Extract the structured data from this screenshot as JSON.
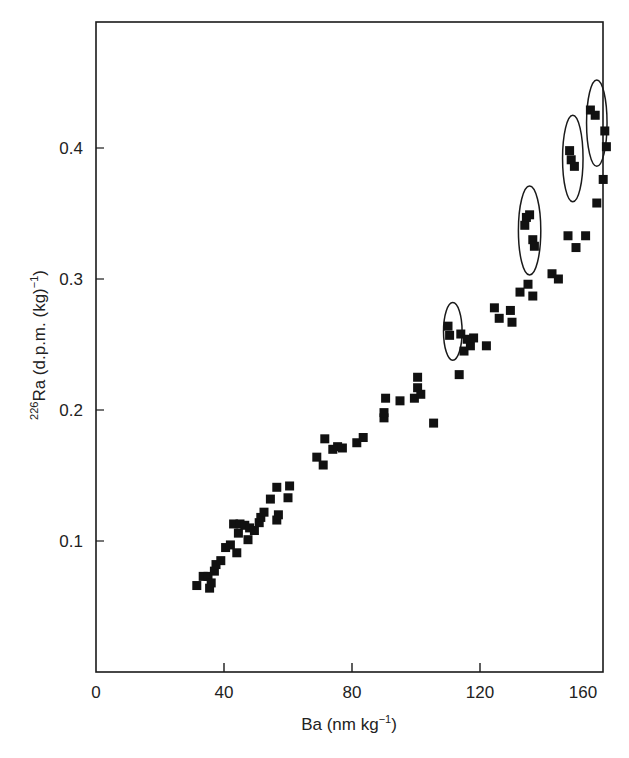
{
  "chart_data": {
    "type": "scatter",
    "title": "",
    "xlabel": "Ba (nm kg⁻¹)",
    "xlabel_parts": {
      "base": "Ba (nm kg",
      "sup": "−1",
      "end": ")"
    },
    "ylabel": "²²⁶Ra (d.p.m. (kg)⁻¹)",
    "ylabel_parts": {
      "pre_sup": "226",
      "base": "Ra (d.p.m. (kg)",
      "sup": "−1",
      "end": ")"
    },
    "xlim": [
      0,
      165
    ],
    "ylim": [
      0,
      0.49
    ],
    "x_ticks": [
      0,
      40,
      80,
      120,
      160
    ],
    "x_tick_labels": [
      "0",
      "40",
      "80",
      "120",
      "160"
    ],
    "y_ticks": [
      0.1,
      0.2,
      0.3,
      0.4
    ],
    "y_tick_labels": [
      "0.1",
      "0.2",
      "0.3",
      "0.4"
    ],
    "grid": false,
    "legend": null,
    "marker": "filled-square",
    "marker_color": "#111111",
    "series": [
      {
        "name": "samples",
        "points": [
          [
            31.5,
            0.066
          ],
          [
            33.5,
            0.073
          ],
          [
            35.0,
            0.073
          ],
          [
            35.5,
            0.064
          ],
          [
            36.0,
            0.068
          ],
          [
            37.0,
            0.077
          ],
          [
            37.5,
            0.082
          ],
          [
            39.0,
            0.085
          ],
          [
            40.5,
            0.095
          ],
          [
            42.0,
            0.097
          ],
          [
            43.0,
            0.113
          ],
          [
            44.0,
            0.091
          ],
          [
            44.5,
            0.106
          ],
          [
            45.0,
            0.113
          ],
          [
            46.5,
            0.112
          ],
          [
            47.5,
            0.101
          ],
          [
            48.0,
            0.11
          ],
          [
            49.5,
            0.108
          ],
          [
            51.0,
            0.114
          ],
          [
            51.5,
            0.118
          ],
          [
            52.5,
            0.122
          ],
          [
            54.5,
            0.132
          ],
          [
            56.5,
            0.141
          ],
          [
            56.5,
            0.116
          ],
          [
            57.0,
            0.12
          ],
          [
            60.0,
            0.133
          ],
          [
            60.5,
            0.142
          ],
          [
            69.0,
            0.164
          ],
          [
            71.0,
            0.158
          ],
          [
            71.5,
            0.178
          ],
          [
            74.0,
            0.17
          ],
          [
            75.5,
            0.172
          ],
          [
            77.0,
            0.171
          ],
          [
            81.5,
            0.175
          ],
          [
            83.5,
            0.179
          ],
          [
            90.0,
            0.194
          ],
          [
            90.0,
            0.198
          ],
          [
            90.5,
            0.209
          ],
          [
            95.0,
            0.207
          ],
          [
            99.5,
            0.209
          ],
          [
            100.5,
            0.217
          ],
          [
            100.5,
            0.225
          ],
          [
            101.5,
            0.212
          ],
          [
            105.5,
            0.19
          ],
          [
            110.0,
            0.264
          ],
          [
            110.5,
            0.257
          ],
          [
            113.5,
            0.227
          ],
          [
            114.0,
            0.258
          ],
          [
            115.0,
            0.245
          ],
          [
            116.0,
            0.254
          ],
          [
            117.0,
            0.249
          ],
          [
            118.0,
            0.255
          ],
          [
            122.0,
            0.249
          ],
          [
            124.5,
            0.278
          ],
          [
            126.0,
            0.27
          ],
          [
            129.5,
            0.276
          ],
          [
            130.0,
            0.267
          ],
          [
            132.5,
            0.29
          ],
          [
            134.0,
            0.341
          ],
          [
            134.5,
            0.347
          ],
          [
            135.0,
            0.296
          ],
          [
            135.5,
            0.349
          ],
          [
            136.5,
            0.287
          ],
          [
            136.5,
            0.33
          ],
          [
            137.0,
            0.325
          ],
          [
            142.5,
            0.304
          ],
          [
            144.5,
            0.3
          ],
          [
            147.5,
            0.333
          ],
          [
            148.0,
            0.398
          ],
          [
            148.5,
            0.391
          ],
          [
            149.5,
            0.386
          ],
          [
            150.0,
            0.324
          ],
          [
            153.0,
            0.333
          ],
          [
            154.5,
            0.429
          ],
          [
            156.0,
            0.425
          ],
          [
            156.5,
            0.358
          ],
          [
            158.5,
            0.376
          ],
          [
            159.0,
            0.413
          ],
          [
            159.5,
            0.401
          ]
        ]
      }
    ],
    "annotations": [
      {
        "type": "ellipse",
        "cx": 111.5,
        "cy": 0.26,
        "rx": 2.9,
        "ry": 0.022,
        "note": "circled group"
      },
      {
        "type": "ellipse",
        "cx": 135.5,
        "cy": 0.337,
        "rx": 3.5,
        "ry": 0.034,
        "note": "circled group"
      },
      {
        "type": "ellipse",
        "cx": 149.0,
        "cy": 0.392,
        "rx": 3.2,
        "ry": 0.033,
        "note": "circled group"
      },
      {
        "type": "ellipse",
        "cx": 156.5,
        "cy": 0.419,
        "rx": 3.2,
        "ry": 0.033,
        "note": "circled group"
      }
    ]
  }
}
